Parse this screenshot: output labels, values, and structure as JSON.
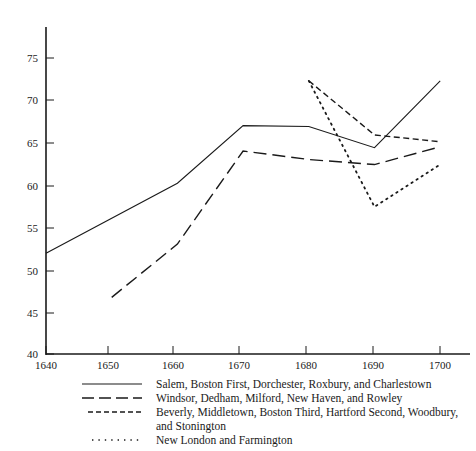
{
  "chart_data": {
    "type": "line",
    "title": "",
    "xlabel": "",
    "ylabel": "",
    "xlim": [
      1640,
      1705
    ],
    "ylim": [
      40,
      78
    ],
    "xticks": [
      "1640",
      "1650",
      "1660",
      "1670",
      "1680",
      "1690",
      "1700"
    ],
    "yticks": [
      "40",
      "45",
      "50",
      "55",
      "60",
      "65",
      "70",
      "75"
    ],
    "grid": false,
    "legend_position": "below-axis",
    "series": [
      {
        "name": "Salem, Boston First, Dorchester, Roxbury, and Charlestown",
        "style": "solid",
        "x": [
          1640,
          1660,
          1670,
          1680,
          1690,
          1700
        ],
        "values": [
          51.9,
          60.2,
          67.0,
          66.9,
          64.4,
          72.3
        ]
      },
      {
        "name": "Windsor, Dedham, Milford, New Haven, and Rowley",
        "style": "long-dash",
        "x": [
          1650,
          1660,
          1670,
          1680,
          1690,
          1700
        ],
        "values": [
          46.7,
          53.0,
          64.0,
          63.0,
          62.4,
          64.5
        ]
      },
      {
        "name": "Beverly, Middletown, Boston Third, Hartford Second, Woodbury, and Stonington",
        "style": "short-dash",
        "x": [
          1680,
          1690,
          1700
        ],
        "values": [
          72.3,
          65.9,
          65.1
        ]
      },
      {
        "name": "New London and Farmington",
        "style": "dotted",
        "x": [
          1680,
          1690,
          1700
        ],
        "values": [
          72.3,
          57.4,
          62.4
        ]
      }
    ]
  },
  "axis": {
    "y_tick_40": "40",
    "y_tick_45": "45",
    "y_tick_50": "50",
    "y_tick_55": "55",
    "y_tick_60": "60",
    "y_tick_65": "65",
    "y_tick_70": "70",
    "y_tick_75": "75",
    "x_tick_1640": "1640",
    "x_tick_1650": "1650",
    "x_tick_1660": "1660",
    "x_tick_1670": "1670",
    "x_tick_1680": "1680",
    "x_tick_1690": "1690",
    "x_tick_1700": "1700"
  },
  "legend": {
    "entry_1": "Salem, Boston First, Dorchester, Roxbury, and Charlestown",
    "entry_2": "Windsor, Dedham, Milford, New Haven, and Rowley",
    "entry_3": "Beverly, Middletown, Boston Third, Hartford Second, Woodbury,",
    "entry_3_cont": "and Stonington",
    "entry_4": "New London and Farmington"
  },
  "colors": {
    "ink": "#1a1a1a",
    "background": "#ffffff"
  }
}
